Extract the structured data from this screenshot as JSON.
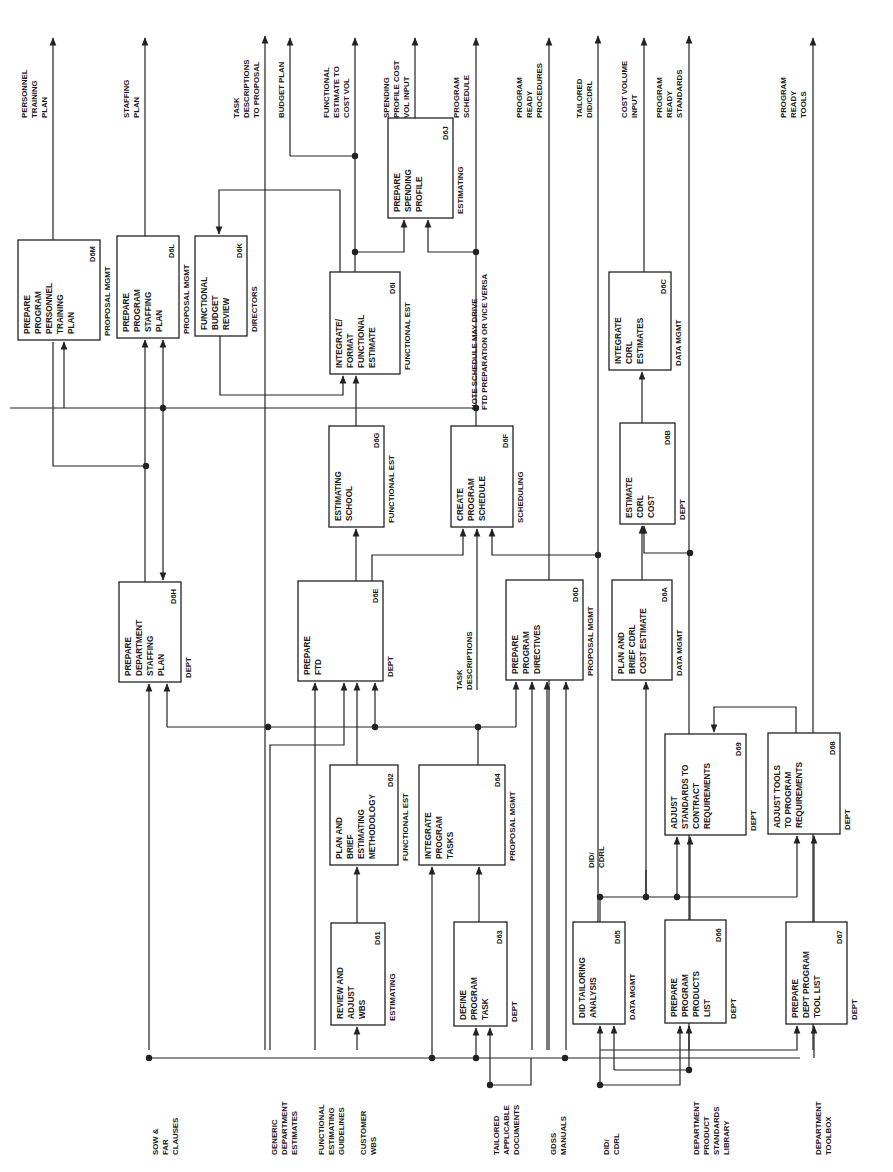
{
  "diagram": {
    "orientation": "rotated-90-ccw",
    "boxes": [
      {
        "id": "D6M",
        "lines": [
          "PREPARE",
          "PROGRAM",
          "PERSONNEL",
          "TRAINING",
          "PLAN"
        ],
        "role": "PROPOSAL MGMT",
        "x": 18,
        "y": 240,
        "w": 82,
        "h": 100
      },
      {
        "id": "D6L",
        "lines": [
          "PREPARE",
          "PROGRAM",
          "STAFFING",
          "PLAN"
        ],
        "role": "PROPOSAL MGMT",
        "x": 117,
        "y": 236,
        "w": 62,
        "h": 102
      },
      {
        "id": "D6K",
        "lines": [
          "FUNCTIONAL",
          "BUDGET",
          "REVIEW"
        ],
        "role": "DIRECTORS",
        "x": 195,
        "y": 236,
        "w": 52,
        "h": 100
      },
      {
        "id": "D6I",
        "lines": [
          "INTEGRATE/",
          "FORMAT",
          "FUNCTIONAL",
          "ESTIMATE"
        ],
        "role": "FUNCTIONAL EST",
        "x": 330,
        "y": 272,
        "w": 70,
        "h": 102
      },
      {
        "id": "D6J",
        "lines": [
          "PREPARE",
          "SPENDING",
          "PROFILE"
        ],
        "role": "ESTIMATING",
        "x": 388,
        "y": 118,
        "w": 65,
        "h": 100
      },
      {
        "id": "D6G",
        "lines": [
          "ESTIMATING",
          "SCHOOL"
        ],
        "role": "FUNCTIONAL EST",
        "x": 329,
        "y": 426,
        "w": 55,
        "h": 101
      },
      {
        "id": "D6F",
        "lines": [
          "CREATE",
          "PROGRAM",
          "SCHEDULE"
        ],
        "role": "SCHEDULING",
        "x": 451,
        "y": 426,
        "w": 62,
        "h": 101
      },
      {
        "id": "D6C",
        "lines": [
          "INTEGRATE",
          "CDRL",
          "ESTIMATES"
        ],
        "role": "DATA MGMT",
        "x": 609,
        "y": 272,
        "w": 62,
        "h": 98
      },
      {
        "id": "D6B",
        "lines": [
          "ESTIMATE",
          "CDRL",
          "COST"
        ],
        "role": "DEPT",
        "x": 620,
        "y": 423,
        "w": 55,
        "h": 101
      },
      {
        "id": "D6H",
        "lines": [
          "PREPARE",
          "DEPARTMENT",
          "STAFFING",
          "PLAN"
        ],
        "role": "DEPT",
        "x": 119,
        "y": 582,
        "w": 62,
        "h": 100
      },
      {
        "id": "D6E",
        "lines": [
          "PREPARE",
          "FTD"
        ],
        "role": "DEPT",
        "x": 298,
        "y": 581,
        "w": 85,
        "h": 100
      },
      {
        "id": "D6D",
        "lines": [
          "PREPARE",
          "PROGRAM",
          "DIRECTIVES"
        ],
        "role": "PROPOSAL MGMT",
        "x": 506,
        "y": 580,
        "w": 77,
        "h": 100
      },
      {
        "id": "D6A",
        "lines": [
          "PLAN AND",
          "BRIEF CDRL",
          "COST ESTIMATE"
        ],
        "role": "DATA MGMT",
        "x": 612,
        "y": 580,
        "w": 60,
        "h": 100
      },
      {
        "id": "D62",
        "lines": [
          "PLAN AND",
          "BRIEF",
          "ESTIMATING",
          "METHODOLOGY"
        ],
        "role": "FUNCTIONAL EST",
        "x": 330,
        "y": 765,
        "w": 68,
        "h": 100
      },
      {
        "id": "D64",
        "lines": [
          "INTEGRATE",
          "PROGRAM",
          "TASKS"
        ],
        "role": "PROPOSAL MGMT",
        "x": 419,
        "y": 765,
        "w": 86,
        "h": 100
      },
      {
        "id": "D69",
        "lines": [
          "ADJUST",
          "STANDARDS TO",
          "CONTRACT",
          "REQUIREMENTS"
        ],
        "role": "DEPT",
        "x": 665,
        "y": 734,
        "w": 81,
        "h": 101
      },
      {
        "id": "D68",
        "lines": [
          "ADJUST TOOLS",
          "TO PROGRAM",
          "REQUIREMENTS"
        ],
        "role": "DEPT",
        "x": 768,
        "y": 733,
        "w": 72,
        "h": 101
      },
      {
        "id": "D61",
        "lines": [
          "REVIEW AND",
          "ADJUST",
          "WBS"
        ],
        "role": "ESTIMATING",
        "x": 331,
        "y": 923,
        "w": 54,
        "h": 102
      },
      {
        "id": "D63",
        "lines": [
          "DEFINE",
          "PROGRAM",
          "TASK"
        ],
        "role": "DEPT",
        "x": 454,
        "y": 922,
        "w": 53,
        "h": 104
      },
      {
        "id": "D65",
        "lines": [
          "DID TAILORING",
          "ANALYSIS"
        ],
        "role": "DATA MGMT",
        "x": 573,
        "y": 922,
        "w": 52,
        "h": 102
      },
      {
        "id": "D66",
        "lines": [
          "PREPARE",
          "PROGRAM",
          "PRODUCTS",
          "LIST"
        ],
        "role": "DEPT",
        "x": 665,
        "y": 920,
        "w": 61,
        "h": 103
      },
      {
        "id": "D67",
        "lines": [
          "PREPARE",
          "DEPT PROGRAM",
          "TOOL LIST"
        ],
        "role": "DEPT",
        "x": 786,
        "y": 922,
        "w": 61,
        "h": 102
      }
    ],
    "outputs": [
      {
        "lines": [
          "PERSONNEL",
          "TRAINING",
          "PLAN"
        ],
        "x": 53
      },
      {
        "lines": [
          "STAFFING",
          "PLAN"
        ],
        "x": 145
      },
      {
        "lines": [
          "TASK",
          "DESCRIPTIONS",
          "TO PROPOSAL"
        ],
        "x": 265
      },
      {
        "lines": [
          "BUDGET PLAN"
        ],
        "x": 290
      },
      {
        "lines": [
          "FUNCTIONAL",
          "ESTIMATE TO",
          "COST VOL"
        ],
        "x": 355
      },
      {
        "lines": [
          "SPENDING",
          "PROFILE COST",
          "VOL INPUT"
        ],
        "x": 415
      },
      {
        "lines": [
          "PROGRAM",
          "SCHEDULE"
        ],
        "x": 475
      },
      {
        "lines": [
          "PROGRAM",
          "READY",
          "PROCEDURES"
        ],
        "x": 548
      },
      {
        "lines": [
          "TAILORED",
          "DID/CDRL"
        ],
        "x": 598
      },
      {
        "lines": [
          "COST VOLUME",
          "INPUT"
        ],
        "x": 643
      },
      {
        "lines": [
          "PROGRAM",
          "READY",
          "STANDARDS"
        ],
        "x": 688
      },
      {
        "lines": [
          "PROGRAM",
          "READY",
          "TOOLS"
        ],
        "x": 812
      }
    ],
    "inputs": [
      {
        "lines": [
          "SOW &",
          "FAR",
          "CLAUSES"
        ],
        "x": 149
      },
      {
        "lines": [
          "GENERIC",
          "DEPARTMENT",
          "ESTIMATES"
        ],
        "x": 268
      },
      {
        "lines": [
          "FUNCTIONAL",
          "ESTIMATING",
          "GUIDELINES"
        ],
        "x": 315
      },
      {
        "lines": [
          "CUSTOMER",
          "WBS"
        ],
        "x": 357
      },
      {
        "lines": [
          "TAILORED",
          "APPLICABLE",
          "DOCUMENTS"
        ],
        "x": 490
      },
      {
        "lines": [
          "GDSS",
          "MANUALS"
        ],
        "x": 547
      },
      {
        "lines": [
          "DID/",
          "CDRL"
        ],
        "x": 600
      },
      {
        "lines": [
          "DEPARTMENT",
          "PRODUCT",
          "STANDARDS",
          "LIBRARY"
        ],
        "x": 690
      },
      {
        "lines": [
          "DEPARTMENT",
          "TOOLBOX"
        ],
        "x": 812
      }
    ],
    "annotations": [
      {
        "name": "schedule-note",
        "lines": [
          "NOTE SCHEDULE MAY DRIVE",
          "FTD PREPARATION OR VICE VERSA"
        ],
        "x": 477,
        "y": 410
      },
      {
        "name": "task-descriptions-label",
        "lines": [
          "TASK",
          "DESCRIPTIONS"
        ],
        "x": 462,
        "y": 690
      },
      {
        "name": "did-cdrl-label",
        "lines": [
          "DID/",
          "CDRL"
        ],
        "x": 594,
        "y": 868
      }
    ]
  }
}
